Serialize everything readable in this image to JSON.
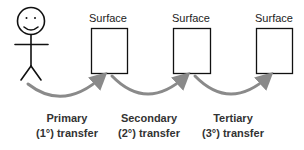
{
  "diagram": {
    "person": {
      "icon": "stick-figure-icon"
    },
    "surfaces": [
      {
        "label": "Surface"
      },
      {
        "label": "Surface"
      },
      {
        "label": "Surface"
      }
    ],
    "transfers": [
      {
        "line1": "Primary",
        "line2": "(1°) transfer"
      },
      {
        "line1": "Secondary",
        "line2": "(2°) transfer"
      },
      {
        "line1": "Tertiary",
        "line2": "(3°) transfer"
      }
    ],
    "colors": {
      "stroke": "#111111",
      "arrow": "#8a8a8a",
      "label_text": "#333333"
    }
  }
}
